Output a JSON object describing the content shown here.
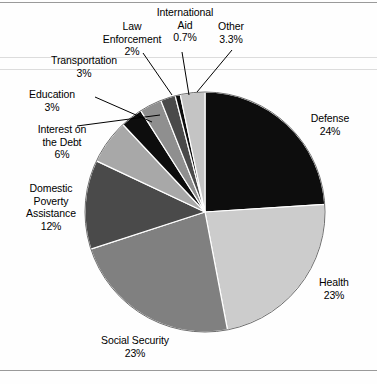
{
  "chart_data": {
    "type": "pie",
    "title": "",
    "subtitle": "",
    "xlabel": "",
    "ylabel": "",
    "legend_position": "callout-labels",
    "grid": false,
    "unit": "%",
    "total": 100,
    "categories": [
      "Defense",
      "Health",
      "Social Security",
      "Domestic Poverty Assistance",
      "Interest on the Debt",
      "Education",
      "Transportation",
      "Law Enforcement",
      "International Aid",
      "Other"
    ],
    "values": [
      24,
      23,
      23,
      12,
      6,
      3,
      3,
      2,
      0.7,
      3.3
    ],
    "value_labels": [
      "24%",
      "23%",
      "23%",
      "12%",
      "6%",
      "3%",
      "3%",
      "2%",
      "0.7%",
      "3.3%"
    ],
    "colors": [
      "#0d0d0d",
      "#cccccc",
      "#808080",
      "#4a4a4a",
      "#a8a8a8",
      "#0d0d0d",
      "#8f8f8f",
      "#4a4a4a",
      "#0d0d0d",
      "#c4c4c4"
    ],
    "slices": [
      {
        "name": "Defense",
        "value": 24,
        "label": "Defense",
        "value_label": "24%",
        "color": "#0d0d0d",
        "start_deg": 0,
        "end_deg": 86.4
      },
      {
        "name": "Health",
        "value": 23,
        "label": "Health",
        "value_label": "23%",
        "color": "#cccccc",
        "start_deg": 86.4,
        "end_deg": 169.2
      },
      {
        "name": "Social Security",
        "value": 23,
        "label": "Social Security",
        "value_label": "23%",
        "color": "#808080",
        "start_deg": 169.2,
        "end_deg": 252.0
      },
      {
        "name": "Domestic Poverty Assistance",
        "value": 12,
        "label": "Domestic Poverty Assistance",
        "value_label": "12%",
        "color": "#4a4a4a",
        "start_deg": 252.0,
        "end_deg": 295.2
      },
      {
        "name": "Interest on the Debt",
        "value": 6,
        "label": "Interest on the Debt",
        "value_label": "6%",
        "color": "#a8a8a8",
        "start_deg": 295.2,
        "end_deg": 316.8
      },
      {
        "name": "Education",
        "value": 3,
        "label": "Education",
        "value_label": "3%",
        "color": "#0d0d0d",
        "start_deg": 316.8,
        "end_deg": 327.6
      },
      {
        "name": "Transportation",
        "value": 3,
        "label": "Transportation",
        "value_label": "3%",
        "color": "#8f8f8f",
        "start_deg": 327.6,
        "end_deg": 338.4
      },
      {
        "name": "Law Enforcement",
        "value": 2,
        "label": "Law Enforcement",
        "value_label": "2%",
        "color": "#4a4a4a",
        "start_deg": 338.4,
        "end_deg": 345.6
      },
      {
        "name": "International Aid",
        "value": 0.7,
        "label": "International Aid",
        "value_label": "0.7%",
        "color": "#0d0d0d",
        "start_deg": 345.6,
        "end_deg": 348.1
      },
      {
        "name": "Other",
        "value": 3.3,
        "label": "Other",
        "value_label": "3.3%",
        "color": "#c4c4c4",
        "start_deg": 348.1,
        "end_deg": 360.0
      }
    ]
  },
  "labels": {
    "defense": {
      "name": "Defense",
      "value": "24%"
    },
    "health": {
      "name": "Health",
      "value": "23%"
    },
    "social_security": {
      "name": "Social Security",
      "value": "23%"
    },
    "domestic_poverty_assistance": {
      "name_line1": "Domestic",
      "name_line2": "Poverty",
      "name_line3": "Assistance",
      "value": "12%"
    },
    "interest_on_the_debt": {
      "name_line1": "Interest on",
      "name_line2": "the Debt",
      "value": "6%"
    },
    "education": {
      "name": "Education",
      "value": "3%"
    },
    "transportation": {
      "name": "Transportation",
      "value": "3%"
    },
    "law_enforcement": {
      "name_line1": "Law",
      "name_line2": "Enforcement",
      "value": "2%"
    },
    "international_aid": {
      "name_line1": "International",
      "name_line2": "Aid",
      "value": "0.7%"
    },
    "other": {
      "name": "Other",
      "value": "3.3%"
    }
  }
}
